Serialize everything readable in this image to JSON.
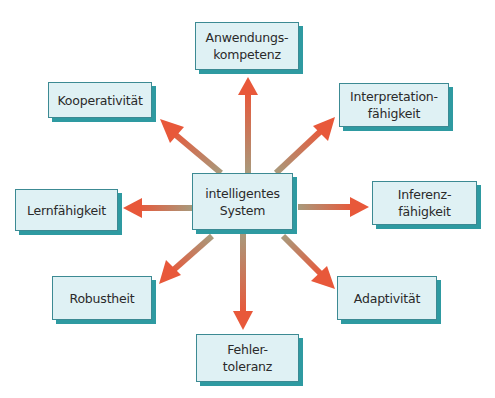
{
  "diagram": {
    "center": {
      "lines": [
        "intelligentes",
        "System"
      ]
    },
    "nodes": [
      {
        "id": "anwendungskompetenz",
        "lines": [
          "Anwendungs-",
          "kompetenz"
        ]
      },
      {
        "id": "kooperativitaet",
        "lines": [
          "Kooperativität"
        ]
      },
      {
        "id": "interpretationfaehigkeit",
        "lines": [
          "Interpretation-",
          "fähigkeit"
        ]
      },
      {
        "id": "lernfaehigkeit",
        "lines": [
          "Lernfähigkeit"
        ]
      },
      {
        "id": "inferenzfaehigkeit",
        "lines": [
          "Inferenz-",
          "fähigkeit"
        ]
      },
      {
        "id": "robustheit",
        "lines": [
          "Robustheit"
        ]
      },
      {
        "id": "adaptivitaet",
        "lines": [
          "Adaptivität"
        ]
      },
      {
        "id": "fehlertoleranz",
        "lines": [
          "Fehler-",
          "toleranz"
        ]
      }
    ],
    "colors": {
      "box_fill": "#dff1f4",
      "box_border": "#3c8a93",
      "box_shadow": "#2e9aa1",
      "arrow_start": "#a89a7c",
      "arrow_end": "#e8583a"
    }
  }
}
